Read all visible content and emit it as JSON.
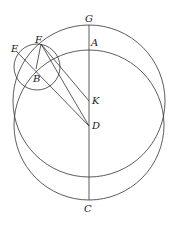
{
  "figure": {
    "type": "geometric-construction",
    "stroke_color": "#333333",
    "background": "#ffffff",
    "points": {
      "G": {
        "label": "G",
        "x": 89,
        "y": 25
      },
      "A": {
        "label": "A",
        "x": 89,
        "y": 50
      },
      "F": {
        "label": "F",
        "x": 41,
        "y": 44
      },
      "E": {
        "label": "E",
        "x": 17,
        "y": 52
      },
      "B": {
        "label": "B",
        "x": 36,
        "y": 69
      },
      "K": {
        "label": "K",
        "x": 89,
        "y": 101
      },
      "D": {
        "label": "D",
        "x": 89,
        "y": 126
      },
      "C": {
        "label": "C",
        "x": 89,
        "y": 200
      }
    },
    "circles": [
      {
        "name": "upper-large-circle",
        "cx": 89,
        "cy": 101,
        "r": 76
      },
      {
        "name": "lower-large-circle",
        "cx": 89,
        "cy": 125,
        "r": 75
      },
      {
        "name": "small-circle",
        "cx": 37,
        "cy": 67,
        "r": 23
      }
    ],
    "segments": [
      {
        "name": "line-GC",
        "from": "G",
        "to": "C"
      },
      {
        "name": "line-FB",
        "from": "F",
        "to": "B"
      },
      {
        "name": "line-ED",
        "from": "E",
        "to": "D"
      },
      {
        "name": "line-FK",
        "from": "F",
        "to": "K"
      },
      {
        "name": "line-FD",
        "from": "F",
        "to": "D"
      }
    ],
    "labels": [
      {
        "text": "G",
        "x": 85,
        "y": 22
      },
      {
        "text": "A",
        "x": 91,
        "y": 46
      },
      {
        "text": "F",
        "x": 35,
        "y": 43
      },
      {
        "text": "E",
        "x": 11,
        "y": 52
      },
      {
        "text": "B",
        "x": 33,
        "y": 82
      },
      {
        "text": "K",
        "x": 92,
        "y": 104
      },
      {
        "text": "D",
        "x": 92,
        "y": 129
      },
      {
        "text": "C",
        "x": 84,
        "y": 212
      }
    ]
  }
}
